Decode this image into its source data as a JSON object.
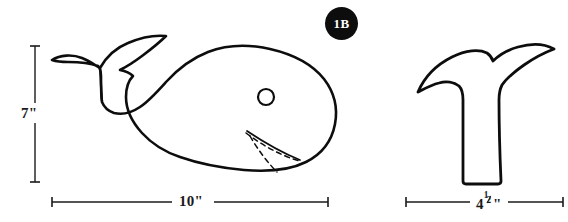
{
  "diagram": {
    "background_color": "#ffffff",
    "ink_color": "#0d0d0d"
  },
  "badge": {
    "label": "1B",
    "background_color": "#0d0d0d",
    "text_color": "#ffffff"
  },
  "pieces": [
    {
      "name": "whale-body",
      "description": "whale body with tail, eye and flipper"
    },
    {
      "name": "tail-fluke",
      "description": "separate tail fluke piece"
    }
  ],
  "dimensions": {
    "height": {
      "value": "7\"",
      "orientation": "vertical",
      "applies_to": "whale-body"
    },
    "body_width": {
      "value": "10\"",
      "orientation": "horizontal",
      "applies_to": "whale-body"
    },
    "tail_width": {
      "whole": "4",
      "numerator": "1",
      "denominator": "2",
      "unit": "\"",
      "value": "4 1/2\"",
      "orientation": "horizontal",
      "applies_to": "tail-fluke"
    }
  }
}
